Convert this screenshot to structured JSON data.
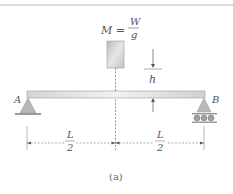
{
  "figure": {
    "mass_label": {
      "lhs": "M =",
      "numerator": "W",
      "denominator": "g"
    },
    "height_label": "h",
    "support_left_label": "A",
    "support_right_label": "B",
    "dimension_left": {
      "numerator": "L",
      "denominator": "2"
    },
    "dimension_right": {
      "numerator": "L",
      "denominator": "2"
    },
    "caption": "(a)"
  },
  "colors": {
    "beam": "#d8d8d8",
    "block": "#c8c8c8",
    "support": "#bdbdbd",
    "line": "#555555",
    "rule": "#cfcfcf"
  }
}
